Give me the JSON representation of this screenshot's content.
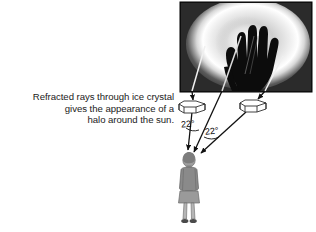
{
  "figure": {
    "background_color": "#ffffff"
  },
  "caption": {
    "text": "Refracted rays through ice crystal\ngives the appearance of a\nhalo around the sun.",
    "line1": "Refracted rays through ice crystal",
    "line2": "gives the appearance of a",
    "line3": "halo around the sun.",
    "color": "#1b1b1b"
  },
  "photo": {
    "name": "halo-photograph",
    "description": "Black and white photograph of a 22 degree solar halo with a hand silhouette blocking the sun",
    "subject": "hand silhouette blocking sun inside bright halo ring",
    "x": 180,
    "y": 2,
    "width": 132,
    "height": 90,
    "border_color": "#000000",
    "halo_color": "#ffffff",
    "sky_color": "#2a2a2a"
  },
  "crystals": [
    {
      "name": "ice-crystal-left",
      "label": "hexagonal ice crystal",
      "cx": 193,
      "cy": 106
    },
    {
      "name": "ice-crystal-right",
      "label": "hexagonal ice crystal",
      "cx": 254,
      "cy": 105
    }
  ],
  "angles": [
    {
      "name": "angle-22-left",
      "value": "22°"
    },
    {
      "name": "angle-22-right",
      "value": "22°"
    }
  ],
  "observer": {
    "name": "observer-figure",
    "description": "person standing and looking up at the halo",
    "coat_color": "#8a8a8a",
    "skirt_color": "#9a9a9a",
    "skin_color": "#a9a9a9"
  },
  "rays": [
    {
      "name": "ray-sun-to-crystal-left",
      "from": "sun",
      "to": "ice-crystal-left"
    },
    {
      "name": "ray-crystal-left-to-eye",
      "from": "ice-crystal-left",
      "to": "observer"
    },
    {
      "name": "ray-sun-to-crystal-right",
      "from": "sun",
      "to": "ice-crystal-right"
    },
    {
      "name": "ray-crystal-right-to-eye",
      "from": "ice-crystal-right",
      "to": "observer"
    },
    {
      "name": "ray-direct-sun-to-eye",
      "from": "sun",
      "to": "observer"
    }
  ],
  "colors": {
    "ray": "#111111",
    "outline": "#333333",
    "text": "#1b1b1b"
  }
}
